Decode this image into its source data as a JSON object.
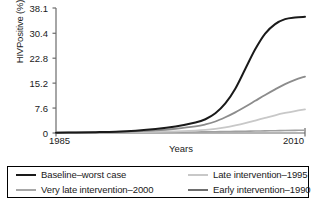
{
  "chart_data": {
    "type": "line",
    "title": "",
    "xlabel": "Years",
    "ylabel": "HIVPositive (%)",
    "xlim": [
      1985,
      2010
    ],
    "ylim": [
      0,
      38.1
    ],
    "grid": false,
    "legend_position": "bottom",
    "xticks": [
      "1985",
      "2010"
    ],
    "yticks": [
      "38.1",
      "30.4",
      "22.8",
      "15.2",
      "7.6",
      "0"
    ],
    "ytick_values": [
      38.1,
      30.4,
      22.8,
      15.2,
      7.6,
      0
    ],
    "x": [
      1985,
      1987,
      1989,
      1991,
      1993,
      1995,
      1997,
      1999,
      2000,
      2001,
      2002,
      2003,
      2004,
      2005,
      2006,
      2007,
      2008,
      2009,
      2010
    ],
    "series": [
      {
        "name": "Baseline–worst case",
        "color": "#1a1a1a",
        "width": 2.0,
        "values": [
          0.1,
          0.15,
          0.25,
          0.4,
          0.7,
          1.2,
          2.0,
          3.2,
          4.2,
          6.0,
          9.0,
          13.5,
          19.5,
          25.5,
          30.3,
          33.2,
          34.7,
          35.2,
          35.4
        ]
      },
      {
        "name": "Early intervention–1990",
        "color": "#8c8c8c",
        "width": 1.8,
        "values": [
          0.1,
          0.12,
          0.2,
          0.3,
          0.5,
          0.8,
          1.3,
          2.0,
          2.6,
          3.5,
          4.8,
          6.3,
          8.0,
          9.8,
          11.6,
          13.3,
          14.9,
          16.2,
          17.2
        ]
      },
      {
        "name": "Late intervention–1995",
        "color": "#c8c8c8",
        "width": 1.8,
        "values": [
          0.08,
          0.1,
          0.13,
          0.18,
          0.25,
          0.35,
          0.5,
          0.75,
          0.95,
          1.25,
          1.7,
          2.3,
          3.0,
          3.8,
          4.6,
          5.4,
          6.1,
          6.7,
          7.2
        ]
      },
      {
        "name": "Very late intervention–2000",
        "color": "#a0a0a0",
        "width": 1.6,
        "values": [
          0.05,
          0.06,
          0.08,
          0.1,
          0.13,
          0.17,
          0.22,
          0.3,
          0.35,
          0.4,
          0.45,
          0.5,
          0.55,
          0.6,
          0.65,
          0.7,
          0.75,
          0.8,
          0.85
        ]
      }
    ]
  },
  "axis": {
    "ylabel": "HIVPositive (%)",
    "xlabel": "Years",
    "xtick_left": "1985",
    "xtick_right": "2010",
    "yticks": [
      "38.1",
      "30.4",
      "22.8",
      "15.2",
      "7.6",
      "0"
    ]
  },
  "legend": {
    "items": [
      {
        "label": "Baseline–worst case",
        "color": "#1a1a1a",
        "thickness": "2.2px"
      },
      {
        "label": "Late intervention–1995",
        "color": "#c8c8c8",
        "thickness": "2px"
      },
      {
        "label": "Very late intervention–2000",
        "color": "#a8a8a8",
        "thickness": "2px"
      },
      {
        "label": "Early intervention–1990",
        "color": "#6e6e6e",
        "thickness": "2.2px"
      }
    ]
  },
  "colors": {
    "axis": "#6b6b6b",
    "text": "#1a1a1a",
    "legend_border": "#000000",
    "background": "#ffffff"
  }
}
